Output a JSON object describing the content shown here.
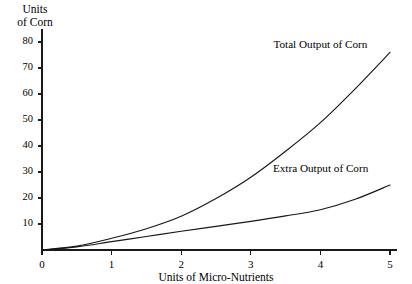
{
  "chart_data": {
    "type": "line",
    "title": "",
    "xlabel": "Units of Micro-Nutrients",
    "ylabel": "Units of Corn",
    "ylabel_line1": "Units",
    "ylabel_line2": "of Corn",
    "xlim": [
      0,
      5.1
    ],
    "ylim": [
      0,
      85
    ],
    "grid": false,
    "legend_position": "inline-right",
    "xticks": [
      0,
      1,
      2,
      3,
      4,
      5
    ],
    "xtick_labels": [
      "0",
      "1",
      "2",
      "3",
      "4",
      "5"
    ],
    "yticks": [
      10,
      20,
      30,
      40,
      50,
      60,
      70,
      80
    ],
    "ytick_labels": [
      "10",
      "20",
      "30",
      "40",
      "50",
      "60",
      "70",
      "80"
    ],
    "x": [
      0,
      0.5,
      1,
      1.5,
      2,
      2.5,
      3,
      3.5,
      4,
      4.5,
      5
    ],
    "series": [
      {
        "name": "Total Output of Corn",
        "label": "Total Output of Corn",
        "values": [
          0,
          1.5,
          4.5,
          8.2,
          13,
          19.8,
          28,
          38,
          49,
          62,
          76
        ]
      },
      {
        "name": "Extra Output of Corn",
        "label": "Extra Output of Corn",
        "values": [
          0,
          1.2,
          3.2,
          5.2,
          7.2,
          9.1,
          11.0,
          13.1,
          15.5,
          19.5,
          25
        ]
      }
    ],
    "annotations": [
      {
        "text": "Total Output of Corn",
        "x": 4.0,
        "y": 79
      },
      {
        "text": "Extra Output of Corn",
        "x": 4.0,
        "y": 31
      }
    ],
    "colors": {
      "line": "#171717",
      "axis": "#1a1a1a",
      "background": "#ffffff"
    }
  }
}
